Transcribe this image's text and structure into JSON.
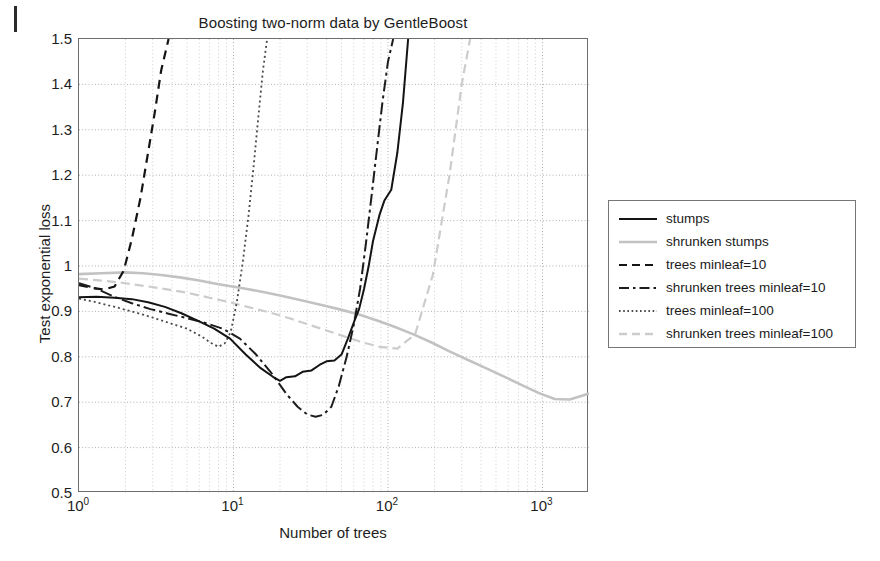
{
  "chart_data": {
    "type": "line",
    "title": "Boosting two-norm data by GentleBoost",
    "xlabel": "Number of trees",
    "ylabel": "Test exponential loss",
    "xscale": "log",
    "xlim": [
      1,
      2000
    ],
    "ylim": [
      0.5,
      1.5
    ],
    "grid": true,
    "legend_position": "right-outside",
    "xticks": [
      "10^0",
      "10^1",
      "10^2",
      "10^3"
    ],
    "xtick_labels": [
      {
        "mantissa": "10",
        "exponent": "0",
        "value": 1
      },
      {
        "mantissa": "10",
        "exponent": "1",
        "value": 10
      },
      {
        "mantissa": "10",
        "exponent": "2",
        "value": 100
      },
      {
        "mantissa": "10",
        "exponent": "3",
        "value": 1000
      }
    ],
    "yticks": [
      0.5,
      0.6,
      0.7,
      0.8,
      0.9,
      1,
      1.1,
      1.2,
      1.3,
      1.4,
      1.5
    ],
    "ytick_labels": [
      "0.5",
      "0.6",
      "0.7",
      "0.8",
      "0.9",
      "1",
      "1.1",
      "1.2",
      "1.3",
      "1.4",
      "1.5"
    ],
    "series": [
      {
        "name": "stumps",
        "color": "#141414",
        "width": 2.0,
        "dash": "none",
        "x": [
          1,
          1.3,
          1.7,
          2.2,
          2.8,
          3.6,
          4.6,
          6,
          7.5,
          9.5,
          12,
          15,
          18,
          20,
          22,
          25,
          28,
          32,
          36,
          40,
          45,
          50,
          55,
          60,
          65,
          70,
          75,
          80,
          88,
          95,
          105,
          115,
          125,
          135
        ],
        "y": [
          0.931,
          0.932,
          0.93,
          0.927,
          0.92,
          0.91,
          0.896,
          0.878,
          0.862,
          0.84,
          0.805,
          0.775,
          0.756,
          0.747,
          0.755,
          0.757,
          0.767,
          0.77,
          0.782,
          0.79,
          0.792,
          0.805,
          0.84,
          0.875,
          0.905,
          0.95,
          1.0,
          1.055,
          1.112,
          1.145,
          1.168,
          1.25,
          1.36,
          1.5
        ]
      },
      {
        "name": "shrunken stumps",
        "color": "#c2c2c2",
        "width": 2.6,
        "dash": "none",
        "x": [
          1,
          1.4,
          2,
          2.6,
          3.4,
          4.5,
          6,
          8,
          11,
          15,
          20,
          27,
          36,
          48,
          65,
          85,
          110,
          145,
          190,
          250,
          330,
          430,
          560,
          730,
          950,
          1200,
          1500,
          1800,
          2000
        ],
        "y": [
          0.982,
          0.984,
          0.986,
          0.984,
          0.98,
          0.975,
          0.968,
          0.96,
          0.952,
          0.944,
          0.935,
          0.925,
          0.915,
          0.905,
          0.893,
          0.88,
          0.866,
          0.85,
          0.832,
          0.812,
          0.793,
          0.775,
          0.757,
          0.738,
          0.72,
          0.707,
          0.706,
          0.714,
          0.719
        ]
      },
      {
        "name": "trees minleaf=10",
        "color": "#141414",
        "width": 2.2,
        "dash": "9,6",
        "x": [
          1,
          1.2,
          1.45,
          1.7,
          1.95,
          2.2,
          2.5,
          2.8,
          3.1,
          3.4,
          3.8
        ],
        "y": [
          0.958,
          0.952,
          0.948,
          0.955,
          0.99,
          1.06,
          1.15,
          1.25,
          1.34,
          1.43,
          1.5
        ]
      },
      {
        "name": "shrunken trees minleaf=10",
        "color": "#1c1c1c",
        "width": 2.0,
        "dash": "12,4,3,4",
        "x": [
          1,
          1.3,
          1.7,
          2.2,
          2.9,
          3.8,
          5,
          6.5,
          8.5,
          11,
          14,
          18,
          22,
          26,
          30,
          34,
          38,
          43,
          48,
          54,
          60,
          66,
          72,
          78,
          85,
          92,
          100,
          108
        ],
        "y": [
          0.962,
          0.95,
          0.932,
          0.918,
          0.905,
          0.895,
          0.885,
          0.875,
          0.862,
          0.84,
          0.805,
          0.76,
          0.718,
          0.69,
          0.673,
          0.668,
          0.672,
          0.69,
          0.735,
          0.8,
          0.87,
          0.95,
          1.05,
          1.15,
          1.26,
          1.36,
          1.45,
          1.5
        ]
      },
      {
        "name": "trees minleaf=100",
        "color": "#4a4a4a",
        "width": 1.8,
        "dash": "2,3",
        "x": [
          1,
          1.3,
          1.7,
          2.2,
          2.9,
          3.8,
          5,
          6.2,
          7.2,
          8,
          8.8,
          9.6,
          10.5,
          11.5,
          12.5,
          13.5,
          14.5,
          15.5,
          16.5
        ],
        "y": [
          0.928,
          0.92,
          0.91,
          0.9,
          0.888,
          0.875,
          0.862,
          0.845,
          0.83,
          0.822,
          0.83,
          0.855,
          0.92,
          1.01,
          1.11,
          1.22,
          1.33,
          1.43,
          1.5
        ]
      },
      {
        "name": "shrunken trees minleaf=100",
        "color": "#cccccc",
        "width": 2.2,
        "dash": "9,5",
        "x": [
          1,
          1.4,
          2,
          2.8,
          3.8,
          5.2,
          7,
          9.5,
          13,
          17,
          23,
          30,
          40,
          52,
          68,
          88,
          115,
          150,
          195,
          250,
          300,
          340
        ],
        "y": [
          0.972,
          0.968,
          0.962,
          0.955,
          0.948,
          0.94,
          0.93,
          0.92,
          0.908,
          0.898,
          0.885,
          0.872,
          0.858,
          0.845,
          0.832,
          0.822,
          0.818,
          0.85,
          0.98,
          1.2,
          1.4,
          1.5
        ]
      }
    ]
  },
  "legend": {
    "entries": [
      {
        "label": "stumps",
        "style": "solid",
        "color": "#141414"
      },
      {
        "label": "shrunken stumps",
        "style": "solid",
        "color": "#c2c2c2"
      },
      {
        "label": "trees minleaf=10",
        "style": "dashed",
        "color": "#141414"
      },
      {
        "label": "shrunken trees minleaf=10",
        "style": "dashdot",
        "color": "#1c1c1c"
      },
      {
        "label": "trees minleaf=100",
        "style": "dotted",
        "color": "#4a4a4a"
      },
      {
        "label": "shrunken trees minleaf=100",
        "style": "dashed",
        "color": "#cccccc"
      }
    ]
  }
}
